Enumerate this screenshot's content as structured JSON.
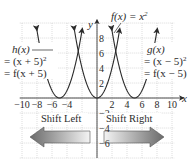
{
  "chart_data": {
    "type": "line",
    "title": "",
    "xlabel": "x",
    "ylabel": "y",
    "xlim": [
      -10.3,
      10.3
    ],
    "ylim": [
      -8,
      10
    ],
    "grid": true,
    "x_ticks": [
      -10,
      -8,
      -6,
      -4,
      2,
      4,
      6,
      8,
      10
    ],
    "x_tick_labels": [
      "−10",
      "−8",
      "−6",
      "−4",
      "2",
      "4",
      "6",
      "8",
      "10"
    ],
    "y_ticks": [
      8,
      6,
      4,
      2,
      -2,
      -4,
      -6
    ],
    "y_tick_labels": [
      "8",
      "6",
      "4",
      "2",
      "−2",
      "−4",
      "−6"
    ],
    "series": [
      {
        "name": "f(x) = x^2",
        "vertex": [
          0,
          0
        ],
        "shift": 0,
        "x": [
          -3,
          -2,
          -1,
          0,
          1,
          2,
          3
        ],
        "y": [
          9,
          4,
          1,
          0,
          1,
          4,
          9
        ]
      },
      {
        "name": "h(x) = (x + 5)^2 = f(x + 5)",
        "vertex": [
          -5,
          0
        ],
        "shift": -5,
        "x": [
          -8,
          -7,
          -6,
          -5,
          -4,
          -3,
          -2
        ],
        "y": [
          9,
          4,
          1,
          0,
          1,
          4,
          9
        ]
      },
      {
        "name": "g(x) = (x − 5)^2 = f(x − 5)",
        "vertex": [
          5,
          0
        ],
        "shift": 5,
        "x": [
          2,
          3,
          4,
          5,
          6,
          7,
          8
        ],
        "y": [
          9,
          4,
          1,
          0,
          1,
          4,
          9
        ]
      }
    ],
    "annotations": [
      {
        "text": "Shift Left",
        "direction": "left"
      },
      {
        "text": "Shift Right",
        "direction": "right"
      }
    ]
  },
  "labels": {
    "f_label": "f(x) = x",
    "f_exp": "2",
    "h_line1": "h(x)",
    "h_line2": "= (x + 5)",
    "h_line2_exp": "2",
    "h_line3": "= f(x + 5)",
    "g_line1": "g(x)",
    "g_line2": "= (x − 5)",
    "g_line2_exp": "2",
    "g_line3": "= f(x − 5)",
    "x_axis": "x",
    "y_axis": "y",
    "shift_left": "Shift Left",
    "shift_right": "Shift Right"
  },
  "colors": {
    "curve": "#2a2a2a",
    "axis": "#3a3a3a",
    "grid": "#b8b8b8",
    "arrow_dark": "#6e6e6e",
    "arrow_light": "#f2f2f2"
  }
}
